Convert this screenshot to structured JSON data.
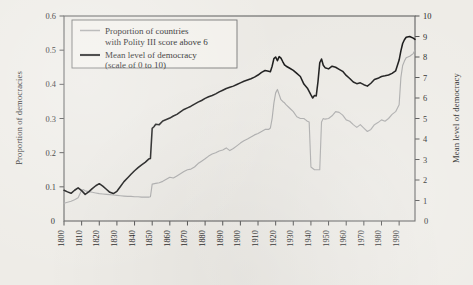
{
  "chart_data": {
    "type": "line",
    "title": "",
    "xlabel": "",
    "ylabel": "Proportion of democracies",
    "ylabel_right": "Mean level of democracy",
    "xlim": [
      1800,
      1999
    ],
    "ylim": [
      0,
      0.6
    ],
    "ylim_right": [
      0,
      10
    ],
    "grid": false,
    "legend_position": "top-left",
    "xticks": [
      1800,
      1810,
      1820,
      1830,
      1840,
      1850,
      1860,
      1870,
      1880,
      1890,
      1900,
      1910,
      1920,
      1930,
      1940,
      1950,
      1960,
      1970,
      1980,
      1990
    ],
    "xtick_labels": [
      "1800",
      "1810",
      "1820",
      "1830",
      "1840",
      "1850",
      "1860",
      "1870",
      "1880",
      "1890",
      "1900",
      "1910",
      "1920",
      "1930",
      "1940",
      "1950",
      "1960",
      "1970",
      "1980",
      "1990"
    ],
    "yticks_left": [
      0,
      0.1,
      0.2,
      0.3,
      0.4,
      0.5,
      0.6
    ],
    "ytick_labels_left": [
      "0",
      "0.1",
      "0.2",
      "0.3",
      "0.4",
      "0.5",
      "0.6"
    ],
    "yticks_right": [
      0,
      1,
      2,
      3,
      4,
      5,
      6,
      7,
      8,
      9,
      10
    ],
    "ytick_labels_right": [
      "0",
      "1",
      "2",
      "3",
      "4",
      "5",
      "6",
      "7",
      "8",
      "9",
      "10"
    ],
    "legend": [
      "Proportion of countries with Polity III score above 6",
      "Mean level of democracy (scale of 0 to 10)"
    ],
    "legend_entries": [
      {
        "line1": "Proportion of countries",
        "line2": "with Polity III score above 6",
        "color": "#a9a9a9",
        "axis": "left"
      },
      {
        "line1": "Mean level of democracy",
        "line2": "(scale of 0 to 10)",
        "color": "#111111",
        "axis": "right"
      }
    ],
    "series": [
      {
        "name": "Mean level of democracy",
        "axis": "right",
        "color": "#111111",
        "units": "scale of 0 to 10",
        "x": [
          1800,
          1802,
          1804,
          1806,
          1808,
          1810,
          1812,
          1814,
          1816,
          1818,
          1820,
          1822,
          1824,
          1826,
          1828,
          1830,
          1832,
          1834,
          1836,
          1838,
          1840,
          1842,
          1844,
          1846,
          1848,
          1849,
          1850,
          1851,
          1852,
          1854,
          1856,
          1858,
          1860,
          1862,
          1864,
          1866,
          1868,
          1870,
          1872,
          1874,
          1876,
          1878,
          1880,
          1882,
          1884,
          1886,
          1888,
          1890,
          1892,
          1894,
          1896,
          1898,
          1900,
          1902,
          1904,
          1906,
          1908,
          1910,
          1912,
          1914,
          1916,
          1917,
          1918,
          1919,
          1920,
          1921,
          1922,
          1923,
          1924,
          1925,
          1926,
          1928,
          1930,
          1932,
          1934,
          1936,
          1938,
          1940,
          1941,
          1942,
          1943,
          1944,
          1945,
          1946,
          1947,
          1948,
          1950,
          1952,
          1954,
          1956,
          1958,
          1960,
          1962,
          1964,
          1966,
          1968,
          1970,
          1972,
          1974,
          1976,
          1978,
          1980,
          1982,
          1984,
          1986,
          1988,
          1990,
          1991,
          1992,
          1993,
          1994,
          1996,
          1998,
          1999
        ],
        "values": [
          1.5,
          1.42,
          1.35,
          1.5,
          1.62,
          1.48,
          1.3,
          1.42,
          1.58,
          1.72,
          1.82,
          1.7,
          1.55,
          1.4,
          1.34,
          1.45,
          1.68,
          1.92,
          2.1,
          2.28,
          2.45,
          2.6,
          2.74,
          2.86,
          3.02,
          3.05,
          4.52,
          4.6,
          4.72,
          4.7,
          4.88,
          4.95,
          5.02,
          5.12,
          5.2,
          5.32,
          5.44,
          5.52,
          5.6,
          5.7,
          5.8,
          5.88,
          5.98,
          6.06,
          6.12,
          6.2,
          6.3,
          6.38,
          6.46,
          6.52,
          6.58,
          6.66,
          6.74,
          6.82,
          6.88,
          6.94,
          7.02,
          7.12,
          7.25,
          7.34,
          7.3,
          7.28,
          7.55,
          7.92,
          8.0,
          7.82,
          8.02,
          7.95,
          7.78,
          7.62,
          7.55,
          7.45,
          7.35,
          7.2,
          7.05,
          6.68,
          6.48,
          6.15,
          6.0,
          6.12,
          6.1,
          6.8,
          7.72,
          7.9,
          7.6,
          7.48,
          7.42,
          7.55,
          7.5,
          7.4,
          7.3,
          7.1,
          6.95,
          6.78,
          6.7,
          6.74,
          6.65,
          6.58,
          6.72,
          6.9,
          6.96,
          7.05,
          7.08,
          7.12,
          7.2,
          7.32,
          7.85,
          8.3,
          8.66,
          8.84,
          8.96,
          9.0,
          8.92,
          8.86
        ]
      },
      {
        "name": "Proportion of countries with Polity III score above 6",
        "axis": "left",
        "color": "#a9a9a9",
        "units": "proportion",
        "x": [
          1800,
          1802,
          1804,
          1806,
          1808,
          1810,
          1811,
          1812,
          1814,
          1816,
          1818,
          1820,
          1822,
          1824,
          1826,
          1828,
          1830,
          1832,
          1834,
          1836,
          1838,
          1840,
          1842,
          1844,
          1846,
          1848,
          1849,
          1850,
          1852,
          1854,
          1856,
          1858,
          1860,
          1862,
          1864,
          1866,
          1868,
          1870,
          1872,
          1874,
          1876,
          1878,
          1880,
          1882,
          1884,
          1886,
          1888,
          1890,
          1892,
          1894,
          1896,
          1898,
          1900,
          1902,
          1904,
          1906,
          1908,
          1910,
          1912,
          1914,
          1916,
          1917,
          1918,
          1919,
          1920,
          1921,
          1922,
          1923,
          1924,
          1925,
          1926,
          1928,
          1930,
          1932,
          1934,
          1936,
          1937,
          1938,
          1939,
          1940,
          1942,
          1944,
          1945,
          1946,
          1947,
          1948,
          1950,
          1952,
          1954,
          1956,
          1958,
          1960,
          1962,
          1964,
          1966,
          1968,
          1970,
          1972,
          1974,
          1976,
          1978,
          1980,
          1982,
          1984,
          1986,
          1988,
          1990,
          1991,
          1992,
          1993,
          1994,
          1996,
          1998,
          1999
        ],
        "values": [
          0.052,
          0.055,
          0.058,
          0.062,
          0.068,
          0.09,
          0.092,
          0.088,
          0.086,
          0.084,
          0.082,
          0.08,
          0.079,
          0.078,
          0.077,
          0.076,
          0.075,
          0.074,
          0.073,
          0.072,
          0.072,
          0.071,
          0.071,
          0.07,
          0.07,
          0.07,
          0.071,
          0.108,
          0.11,
          0.112,
          0.116,
          0.122,
          0.128,
          0.126,
          0.132,
          0.138,
          0.145,
          0.15,
          0.152,
          0.158,
          0.168,
          0.175,
          0.182,
          0.19,
          0.196,
          0.2,
          0.205,
          0.208,
          0.214,
          0.206,
          0.212,
          0.22,
          0.228,
          0.235,
          0.24,
          0.246,
          0.252,
          0.256,
          0.262,
          0.268,
          0.268,
          0.272,
          0.3,
          0.345,
          0.375,
          0.385,
          0.37,
          0.355,
          0.35,
          0.346,
          0.34,
          0.33,
          0.32,
          0.305,
          0.3,
          0.3,
          0.296,
          0.292,
          0.29,
          0.158,
          0.15,
          0.15,
          0.15,
          0.29,
          0.3,
          0.298,
          0.3,
          0.308,
          0.32,
          0.318,
          0.31,
          0.296,
          0.292,
          0.282,
          0.274,
          0.282,
          0.272,
          0.262,
          0.268,
          0.282,
          0.288,
          0.296,
          0.292,
          0.3,
          0.312,
          0.32,
          0.34,
          0.42,
          0.455,
          0.468,
          0.478,
          0.482,
          0.49,
          0.5
        ]
      }
    ],
    "annotations": []
  },
  "style": {
    "background": "#eeece7",
    "plot_background": "#ebe9e4",
    "frame_color": "#5e5e5e",
    "black_series_color": "#111111",
    "gray_series_color": "#a9a9a9"
  }
}
